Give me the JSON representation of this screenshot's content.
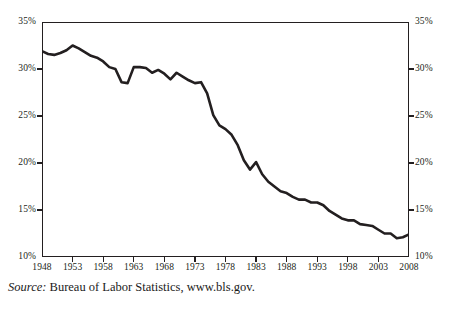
{
  "chart_data": {
    "type": "line",
    "title": "",
    "subtitle": "",
    "xlabel": "",
    "ylabel": "",
    "xlim": [
      1948,
      2008
    ],
    "ylim": [
      10,
      35
    ],
    "y_unit": "%",
    "grid": false,
    "legend": "none",
    "dual_y_axis": true,
    "y_ticks": [
      35,
      30,
      25,
      20,
      15,
      10
    ],
    "y_tick_labels_left": [
      "35%",
      "30%",
      "25%",
      "20%",
      "15%",
      "10%"
    ],
    "y_tick_labels_right": [
      "35%",
      "30%",
      "25%",
      "20%",
      "15%",
      "10%"
    ],
    "x_ticks": [
      1948,
      1953,
      1958,
      1963,
      1968,
      1973,
      1978,
      1983,
      1988,
      1993,
      1998,
      2003,
      2008
    ],
    "x_tick_labels": [
      "1948",
      "1953",
      "1958",
      "1963",
      "1968",
      "1973",
      "1978",
      "1983",
      "1988",
      "1993",
      "1998",
      "2003",
      "2008"
    ],
    "line_color": "#231f20",
    "line_width": 2.6,
    "series": [
      {
        "name": "Union membership rate",
        "x": [
          1948,
          1949,
          1950,
          1951,
          1952,
          1953,
          1954,
          1955,
          1956,
          1957,
          1958,
          1959,
          1960,
          1961,
          1962,
          1963,
          1964,
          1965,
          1966,
          1967,
          1968,
          1969,
          1970,
          1971,
          1972,
          1973,
          1974,
          1975,
          1976,
          1977,
          1978,
          1979,
          1980,
          1981,
          1982,
          1983,
          1984,
          1985,
          1986,
          1987,
          1988,
          1989,
          1990,
          1991,
          1992,
          1993,
          1994,
          1995,
          1996,
          1997,
          1998,
          1999,
          2000,
          2001,
          2002,
          2003,
          2004,
          2005,
          2006,
          2007,
          2008
        ],
        "values": [
          31.9,
          31.6,
          31.5,
          31.7,
          32.0,
          32.5,
          32.2,
          31.8,
          31.4,
          31.2,
          30.8,
          30.2,
          30.0,
          28.6,
          28.5,
          30.2,
          30.2,
          30.1,
          29.6,
          29.9,
          29.5,
          28.9,
          29.6,
          29.2,
          28.8,
          28.5,
          28.6,
          27.4,
          25.1,
          24.0,
          23.6,
          23.0,
          21.9,
          20.3,
          19.3,
          20.1,
          18.8,
          18.0,
          17.5,
          17.0,
          16.8,
          16.4,
          16.1,
          16.1,
          15.8,
          15.8,
          15.5,
          14.9,
          14.5,
          14.1,
          13.9,
          13.9,
          13.5,
          13.4,
          13.3,
          12.9,
          12.5,
          12.5,
          12.0,
          12.1,
          12.4
        ]
      }
    ]
  },
  "axes": {
    "y_left": [
      {
        "label": "35%",
        "value": 35
      },
      {
        "label": "30%",
        "value": 30
      },
      {
        "label": "25%",
        "value": 25
      },
      {
        "label": "20%",
        "value": 20
      },
      {
        "label": "15%",
        "value": 15
      },
      {
        "label": "10%",
        "value": 10
      }
    ],
    "y_right": [
      {
        "label": "35%",
        "value": 35
      },
      {
        "label": "30%",
        "value": 30
      },
      {
        "label": "25%",
        "value": 25
      },
      {
        "label": "20%",
        "value": 20
      },
      {
        "label": "15%",
        "value": 15
      },
      {
        "label": "10%",
        "value": 10
      }
    ],
    "x": [
      {
        "label": "1948",
        "value": 1948
      },
      {
        "label": "1953",
        "value": 1953
      },
      {
        "label": "1958",
        "value": 1958
      },
      {
        "label": "1963",
        "value": 1963
      },
      {
        "label": "1968",
        "value": 1968
      },
      {
        "label": "1973",
        "value": 1973
      },
      {
        "label": "1978",
        "value": 1978
      },
      {
        "label": "1983",
        "value": 1983
      },
      {
        "label": "1988",
        "value": 1988
      },
      {
        "label": "1993",
        "value": 1993
      },
      {
        "label": "1998",
        "value": 1998
      },
      {
        "label": "2003",
        "value": 2003
      },
      {
        "label": "2008",
        "value": 2008
      }
    ]
  },
  "source": {
    "prefix": "Source:",
    "text": "Bureau of Labor Statistics, www.bls.gov."
  },
  "colors": {
    "line": "#231f20",
    "frame": "#231f20",
    "text": "#1a1a1a",
    "background": "#ffffff"
  }
}
